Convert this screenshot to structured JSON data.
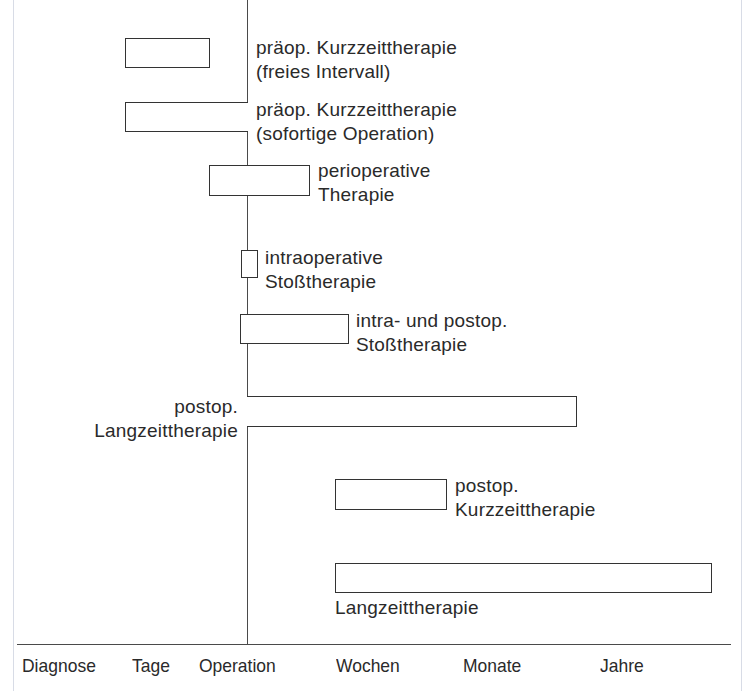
{
  "diagram": {
    "title": "",
    "axis": {
      "labels": [
        "Diagnose",
        "Tage",
        "Operation",
        "Wochen",
        "Monate",
        "Jahre"
      ]
    },
    "bars": [
      {
        "id": "praeop-kurz-frei",
        "label_line1": "präop. Kurzzeittherapie",
        "label_line2": "(freies Intervall)"
      },
      {
        "id": "praeop-kurz-sofort",
        "label_line1": "präop. Kurzzeittherapie",
        "label_line2": "(sofortige Operation)"
      },
      {
        "id": "perioperativ",
        "label_line1": "perioperative",
        "label_line2": "Therapie"
      },
      {
        "id": "intraop-stoss",
        "label_line1": "intraoperative",
        "label_line2": "Stoßtherapie"
      },
      {
        "id": "intra-postop-stoss",
        "label_line1": "intra- und postop.",
        "label_line2": "Stoßtherapie"
      },
      {
        "id": "postop-lang",
        "label_line1": "postop.",
        "label_line2": "Langzeittherapie"
      },
      {
        "id": "postop-kurz",
        "label_line1": "postop.",
        "label_line2": "Kurzzeittherapie"
      },
      {
        "id": "langzeit",
        "label_line1": "Langzeittherapie",
        "label_line2": ""
      }
    ],
    "colors": {
      "line": "#4a4a4a",
      "bar_border": "#333333",
      "background": "#ffffff"
    }
  }
}
